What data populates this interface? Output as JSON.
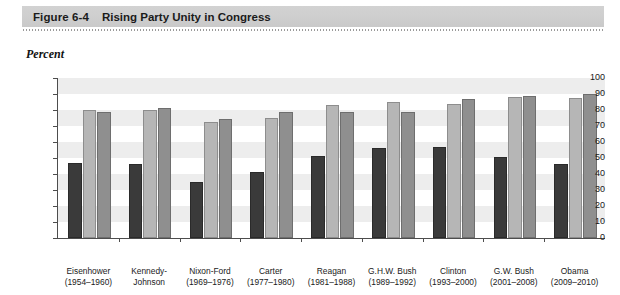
{
  "figure": {
    "number": "Figure 6-4",
    "title": "Rising Party Unity in Congress"
  },
  "axis_caption": "Percent",
  "chart_data": {
    "type": "bar",
    "title": "Rising Party Unity in Congress",
    "xlabel": "",
    "ylabel": "Percent",
    "ylim": [
      0,
      100
    ],
    "yticks": [
      0,
      10,
      20,
      30,
      40,
      50,
      60,
      70,
      80,
      90,
      100
    ],
    "grid": "horizontal-bands",
    "legend": "none",
    "categories": [
      "Eisenhower (1954–1960)",
      "Kennedy-Johnson",
      "Nixon-Ford (1969–1976)",
      "Carter (1977–1980)",
      "Reagan (1981–1988)",
      "G.H.W. Bush (1989–1992)",
      "Clinton (1993–2000)",
      "G.W. Bush (2001–2008)",
      "Obama (2009–2010)"
    ],
    "category_lines": [
      [
        "Eisenhower",
        "(1954–1960)"
      ],
      [
        "Kennedy-",
        "Johnson"
      ],
      [
        "Nixon-Ford",
        "(1969–1976)"
      ],
      [
        "Carter",
        "(1977–1980)"
      ],
      [
        "Reagan",
        "(1981–1988)"
      ],
      [
        "G.H.W. Bush",
        "(1989–1992)"
      ],
      [
        "Clinton",
        "(1993–2000)"
      ],
      [
        "G.W. Bush",
        "(2001–2008)"
      ],
      [
        "Obama",
        "(2009–2010)"
      ]
    ],
    "series": [
      {
        "name": "series-dark",
        "color": "#3a3a3a",
        "values": [
          47,
          46.5,
          35,
          41,
          51.5,
          56,
          57,
          50.5,
          46.5
        ]
      },
      {
        "name": "series-light",
        "color": "#b6b6b6",
        "values": [
          80,
          80,
          72.5,
          75,
          83,
          85,
          83.5,
          88,
          87.5
        ]
      },
      {
        "name": "series-medium",
        "color": "#8f8f8f",
        "values": [
          78.5,
          81,
          74.5,
          78.5,
          78.5,
          79,
          87,
          89,
          90
        ]
      }
    ]
  }
}
